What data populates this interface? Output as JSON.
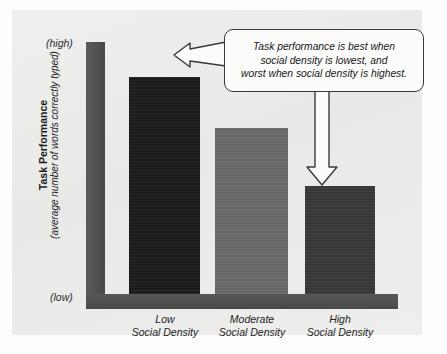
{
  "chart_data": {
    "type": "bar",
    "title": "",
    "subtitle": "",
    "xlabel": "",
    "ylabel": "Task Performance",
    "ylabel_sub": "(average number of words correctly typed)",
    "y_axis_top_label": "(high)",
    "y_axis_bottom_label": "(low)",
    "ylim": [
      0,
      100
    ],
    "grid": false,
    "legend": "none",
    "categories": [
      "Low\nSocial Density",
      "Moderate\nSocial Density",
      "High\nSocial Density"
    ],
    "category_lines": [
      [
        "Low",
        "Social Density"
      ],
      [
        "Moderate",
        "Social Density"
      ],
      [
        "High",
        "Social Density"
      ]
    ],
    "values": [
      86,
      66,
      43
    ],
    "bar_colors": [
      "#1c1c1c",
      "#6b6b6b",
      "#3a3a3a"
    ],
    "annotations": [
      {
        "text": "Task performance is best when social density is lowest, and worst when social density is highest.",
        "lines": [
          "Task performance is best when",
          "social density is lowest, and",
          "worst when social density is highest."
        ],
        "points_to": [
          "Low Social Density",
          "High Social Density"
        ]
      }
    ]
  },
  "colors": {
    "panel_background": "#ececeb",
    "axis": "#4f4f4f",
    "callout_border": "#3a3a3a",
    "callout_fill": "#fbfbfa",
    "text": "#1d1d1d"
  },
  "icons": {
    "arrow_left": "arrow-left-icon",
    "arrow_down": "arrow-down-icon"
  }
}
